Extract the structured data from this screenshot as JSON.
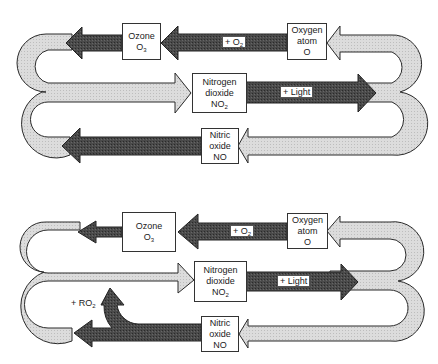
{
  "colors": {
    "light_arrow": "#d9d9d9",
    "dark_arrow": "#3e3e3e",
    "outline": "#2a2a2a",
    "box_fill": "#ffffff"
  },
  "diagrams": [
    {
      "id": "top",
      "boxes": {
        "ozone": {
          "line1": "Ozone",
          "formula": "O",
          "sub": "3"
        },
        "oxygen_atom": {
          "line1": "Oxygen",
          "line2": "atom",
          "formula": "O"
        },
        "nitrogen_dioxide": {
          "line1": "Nitrogen",
          "line2": "dioxide",
          "formula": "NO",
          "sub": "2"
        },
        "nitric_oxide": {
          "line1": "Nitric",
          "line2": "oxide",
          "formula": "NO"
        }
      },
      "labels": {
        "plus_o2": {
          "text": "+ O",
          "sub": "2"
        },
        "plus_light": {
          "text": "+ Light"
        }
      }
    },
    {
      "id": "bottom",
      "boxes": {
        "ozone": {
          "line1": "Ozone",
          "formula": "O",
          "sub": "3"
        },
        "oxygen_atom": {
          "line1": "Oxygen",
          "line2": "atom",
          "formula": "O"
        },
        "nitrogen_dioxide": {
          "line1": "Nitrogen",
          "line2": "dioxide",
          "formula": "NO",
          "sub": "2"
        },
        "nitric_oxide": {
          "line1": "Nitric",
          "line2": "oxide",
          "formula": "NO"
        }
      },
      "labels": {
        "plus_o2": {
          "text": "+ O",
          "sub": "2"
        },
        "plus_light": {
          "text": "+ Light"
        },
        "plus_ro2": {
          "text": "+ RO",
          "sub": "2"
        }
      }
    }
  ]
}
